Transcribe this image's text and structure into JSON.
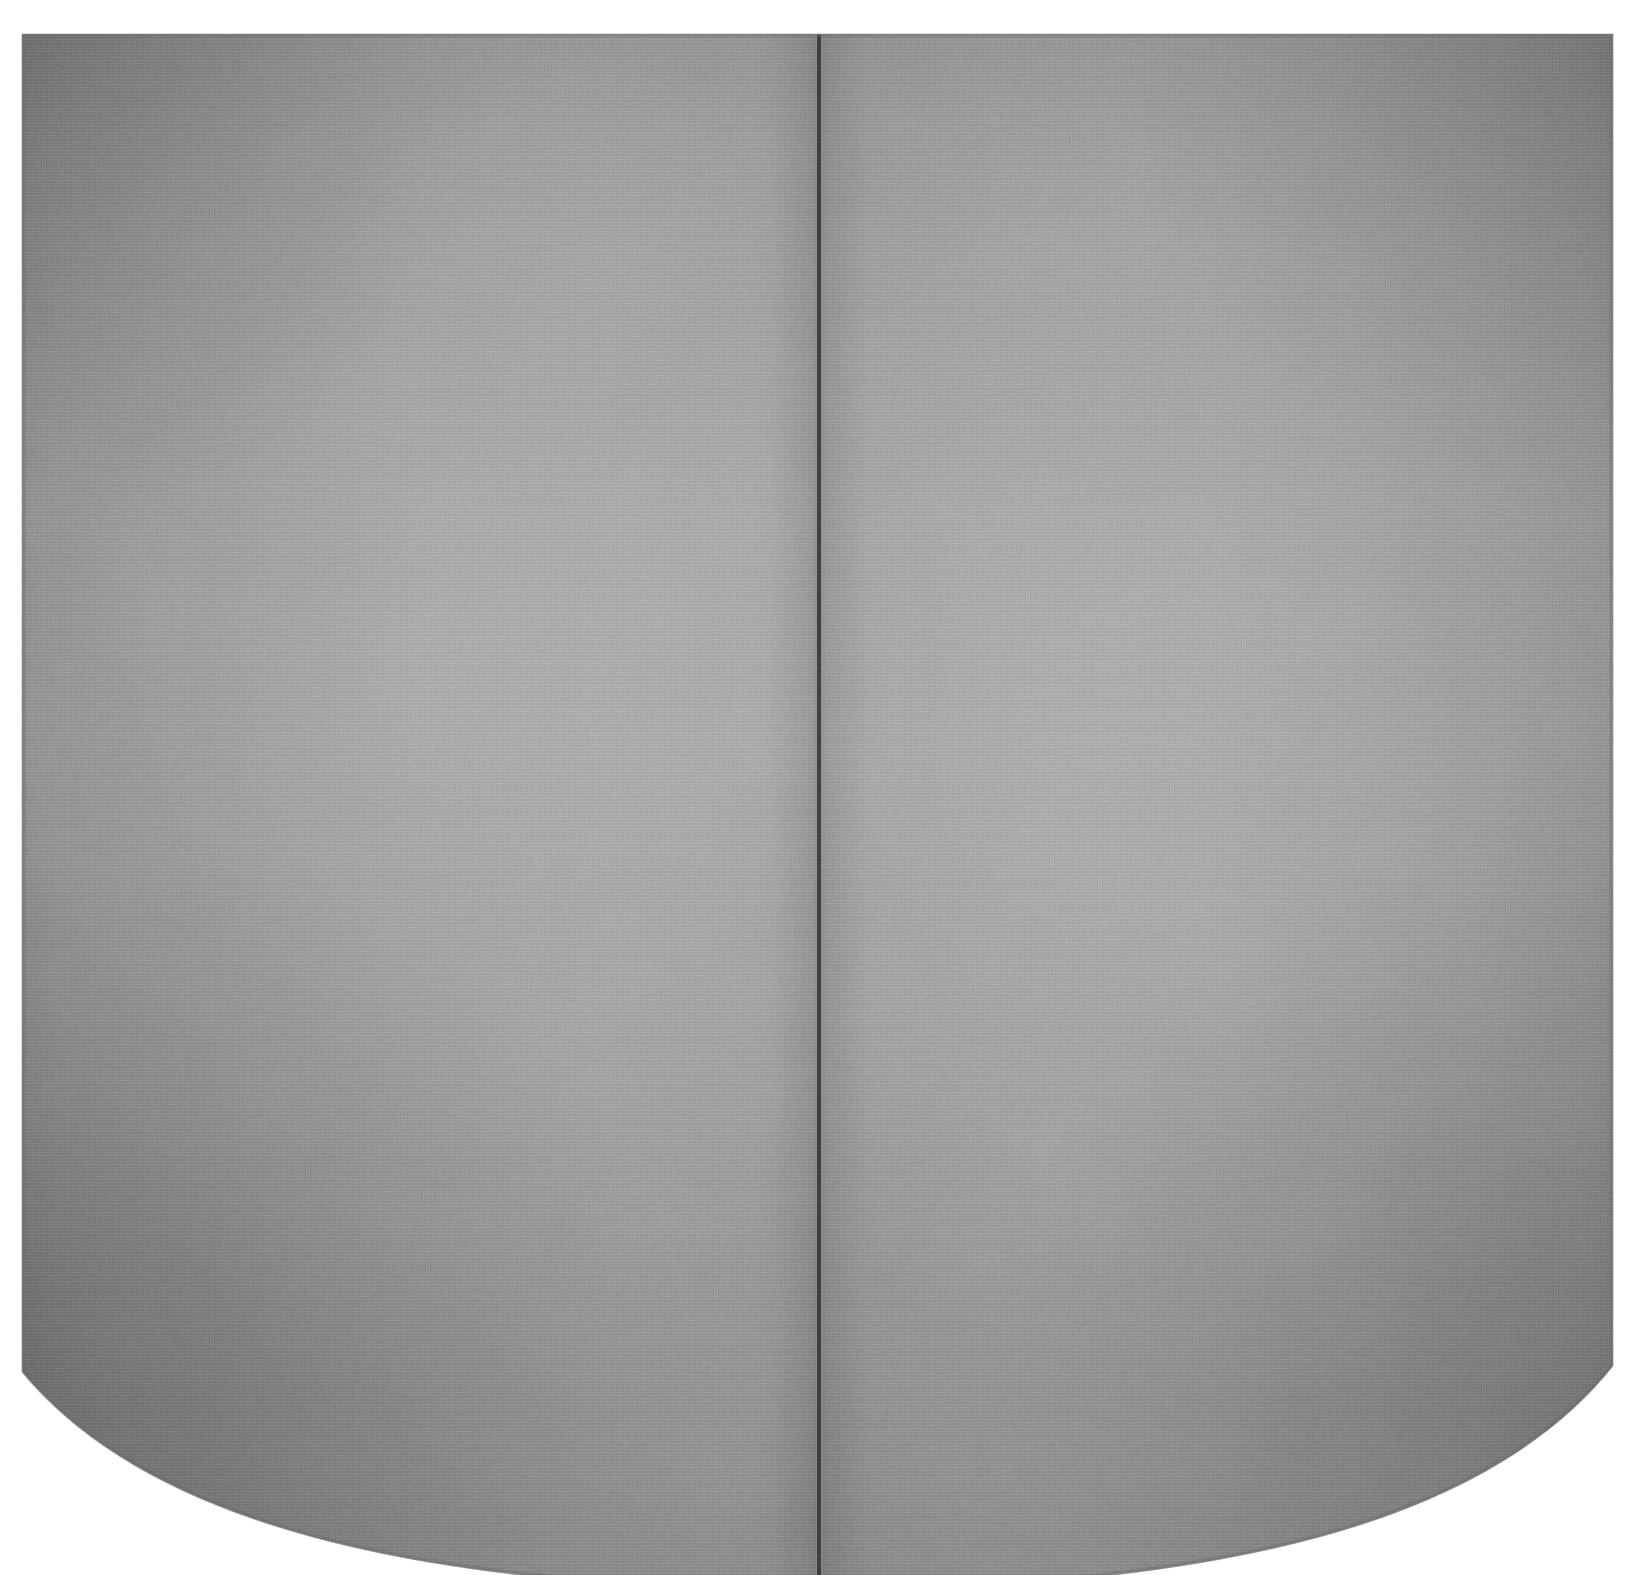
{
  "artwork": {
    "shape_name": "shaped-canvas-diptych",
    "panel_count": 2,
    "surface_description": "monochrome gray painted canvas",
    "edges": {
      "top": "straight",
      "left": "straight",
      "right": "straight",
      "bottom": "convex-curve"
    },
    "geometry": {
      "left_edge_x": 22,
      "right_edge_x": 1613,
      "top_edge_y": 34,
      "left_corner_y": 1372,
      "right_corner_y": 1366,
      "bottom_apex_y": 1590,
      "seam_x": 819,
      "seam_width": 4
    },
    "panels": [
      {
        "id": "left-panel",
        "label": "left panel"
      },
      {
        "id": "right-panel",
        "label": "right panel"
      }
    ]
  },
  "colors": {
    "background": "#ffffff",
    "gray_base": "#949494",
    "gray_light": "#9e9e9e",
    "gray_mid": "#959595",
    "gray_edge_dark": "#858585",
    "gray_corner_dark": "#7d7d7d",
    "gray_bottom_dark": "#828282",
    "seam_dark": "#3a3a3a",
    "seam_soft": "#6f6f6f",
    "edge_line": "#6b6b6b"
  },
  "caption": ""
}
